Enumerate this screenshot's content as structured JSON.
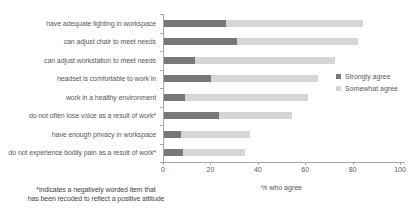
{
  "chart_data": {
    "type": "bar",
    "orientation": "horizontal",
    "stacked": true,
    "categories": [
      "have adequate lighting in workspace",
      "can adjust chair to meet needs",
      "can adjust workstation to meet needs",
      "headset is comfortable to work in",
      "work in a healthy environment",
      "do not often lose voice as a result of work*",
      "have enough privacy in workspace",
      "do not experience bodily pain as a result of work*"
    ],
    "series": [
      {
        "name": "Strongly agree",
        "color": "#787878",
        "values": [
          26,
          31,
          13,
          20,
          9,
          23,
          7,
          8
        ]
      },
      {
        "name": "Somewhat agree",
        "color": "#d6d6d6",
        "values": [
          58,
          51,
          59,
          45,
          52,
          31,
          29,
          26
        ]
      }
    ],
    "xlabel": "% who agree",
    "xlim": [
      0,
      100
    ],
    "xticks": [
      0,
      20,
      40,
      60,
      80,
      100
    ],
    "grid": false,
    "legend_position": "center-right",
    "footnote_line1": "*indicates a negatively worded item that",
    "footnote_line2": "has been recoded to reflect a positive attitude"
  },
  "colors": {
    "strongly_agree": "#787878",
    "somewhat_agree": "#d6d6d6",
    "axis": "#a6a6a6",
    "text": "#595959",
    "footnote_text": "#454545",
    "background": "#ffffff"
  }
}
